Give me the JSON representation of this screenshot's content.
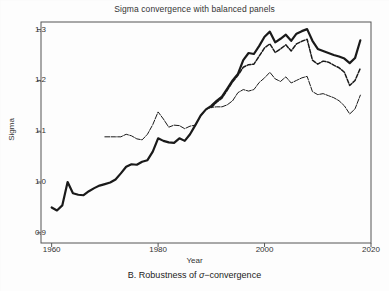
{
  "chart_data": {
    "type": "line",
    "title": "Sigma convergence with balanced panels",
    "caption": "B. Robustness of σ−convergence",
    "caption_prefix": "B. Robustness of ",
    "caption_sigma": "σ",
    "caption_suffix": "−convergence",
    "xlabel": "Year",
    "ylabel": "Sigma",
    "xlim": [
      1958,
      2020
    ],
    "ylim": [
      0.88,
      1.315
    ],
    "xticks": [
      1960,
      1980,
      2000,
      2020
    ],
    "xticklabels": [
      "1960",
      "1980",
      "2000",
      "2020"
    ],
    "yticks": [
      0.9,
      1.0,
      1.1,
      1.2,
      1.3
    ],
    "yticklabels": [
      "0.9",
      "1.0",
      "1.1",
      "1.2",
      "1.3"
    ],
    "grid": false,
    "legend": "none",
    "line_color": "#1a1a1a",
    "background_color": "#fdfdfd",
    "series": [
      {
        "name": "Full sample (thick solid)",
        "style": "solid",
        "width": 2.2,
        "x": [
          1960,
          1961,
          1962,
          1963,
          1964,
          1965,
          1966,
          1967,
          1968,
          1969,
          1970,
          1971,
          1972,
          1973,
          1974,
          1975,
          1976,
          1977,
          1978,
          1979,
          1980,
          1981,
          1982,
          1983,
          1984,
          1985,
          1986,
          1987,
          1988,
          1989,
          1990,
          1991,
          1992,
          1993,
          1994,
          1995,
          1996,
          1997,
          1998,
          1999,
          2000,
          2001,
          2002,
          2003,
          2004,
          2005,
          2006,
          2007,
          2008,
          2009,
          2010,
          2011,
          2012,
          2013,
          2014,
          2015,
          2016,
          2017,
          2018
        ],
        "y": [
          0.95,
          0.944,
          0.954,
          1.0,
          0.978,
          0.975,
          0.974,
          0.982,
          0.988,
          0.993,
          0.996,
          0.999,
          1.005,
          1.017,
          1.03,
          1.035,
          1.034,
          1.04,
          1.043,
          1.06,
          1.086,
          1.081,
          1.078,
          1.077,
          1.086,
          1.081,
          1.094,
          1.112,
          1.131,
          1.143,
          1.15,
          1.16,
          1.168,
          1.184,
          1.2,
          1.213,
          1.24,
          1.254,
          1.252,
          1.268,
          1.286,
          1.296,
          1.275,
          1.282,
          1.29,
          1.278,
          1.292,
          1.297,
          1.301,
          1.278,
          1.262,
          1.258,
          1.254,
          1.25,
          1.247,
          1.243,
          1.234,
          1.244,
          1.279
        ]
      },
      {
        "name": "Balanced panel A (medium dashed)",
        "style": "dashed",
        "width": 1.5,
        "x": [
          1990,
          1991,
          1992,
          1993,
          1994,
          1995,
          1996,
          1997,
          1998,
          1999,
          2000,
          2001,
          2002,
          2003,
          2004,
          2005,
          2006,
          2007,
          2008,
          2009,
          2010,
          2011,
          2012,
          2013,
          2014,
          2015,
          2016,
          2017,
          2018
        ],
        "y": [
          1.147,
          1.157,
          1.165,
          1.181,
          1.197,
          1.21,
          1.226,
          1.231,
          1.232,
          1.248,
          1.264,
          1.272,
          1.255,
          1.262,
          1.27,
          1.258,
          1.272,
          1.277,
          1.281,
          1.24,
          1.232,
          1.238,
          1.236,
          1.23,
          1.225,
          1.216,
          1.19,
          1.2,
          1.224
        ]
      },
      {
        "name": "Balanced panel B (thin)",
        "style": "thin-mixed",
        "width": 1.0,
        "x": [
          1970,
          1971,
          1972,
          1973,
          1974,
          1975,
          1976,
          1977,
          1978,
          1979,
          1980,
          1981,
          1982,
          1983,
          1984,
          1985,
          1986,
          1987,
          1988,
          1989,
          1990,
          1991,
          1992,
          1993,
          1994,
          1995,
          1996,
          1997,
          1998,
          1999,
          2000,
          2001,
          2002,
          2003,
          2004,
          2005,
          2006,
          2007,
          2008,
          2009,
          2010,
          2011,
          2012,
          2013,
          2014,
          2015,
          2016,
          2017,
          2018
        ],
        "y": [
          1.089,
          1.089,
          1.089,
          1.089,
          1.094,
          1.091,
          1.085,
          1.083,
          1.094,
          1.113,
          1.138,
          1.124,
          1.108,
          1.112,
          1.111,
          1.105,
          1.11,
          1.112,
          1.13,
          1.143,
          1.147,
          1.148,
          1.148,
          1.152,
          1.16,
          1.176,
          1.182,
          1.179,
          1.182,
          1.196,
          1.205,
          1.216,
          1.203,
          1.198,
          1.207,
          1.195,
          1.2,
          1.205,
          1.208,
          1.178,
          1.172,
          1.174,
          1.17,
          1.166,
          1.16,
          1.15,
          1.134,
          1.144,
          1.171
        ]
      }
    ]
  }
}
